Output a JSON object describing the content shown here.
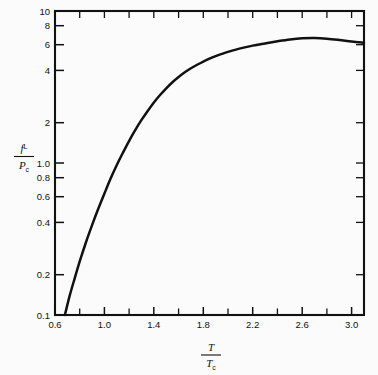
{
  "figure": {
    "background_color": "#fbfbfb",
    "ink_color": "#111111",
    "y_axis_label_numerator": "f",
    "y_axis_label_numerator_sup": "L",
    "y_axis_label_denominator": "P",
    "y_axis_label_denominator_sub": "c",
    "x_axis_label_numerator": "T",
    "x_axis_label_denominator": "T",
    "x_axis_label_denominator_sub": "c"
  },
  "chart_data": {
    "type": "line",
    "title": "",
    "subtitle": "",
    "xlabel": "T/Tc",
    "ylabel": "f L/Pc",
    "xscale": "linear",
    "yscale": "log",
    "xlim": [
      0.6,
      3.1
    ],
    "ylim": [
      0.1,
      10
    ],
    "grid": false,
    "legend": null,
    "x_major_ticks": [
      0.6,
      1.0,
      1.4,
      1.8,
      2.2,
      2.6,
      3.0
    ],
    "x_major_tick_labels": [
      "0.6",
      "1.0",
      "1.4",
      "1.8",
      "2.2",
      "2.6",
      "3.0"
    ],
    "x_minor_ticks": [
      0.8,
      1.2,
      1.6,
      2.0,
      2.4,
      2.8
    ],
    "y_major_ticks": [
      0.1,
      0.2,
      0.4,
      0.6,
      0.8,
      1.0,
      2,
      4,
      6,
      8,
      10
    ],
    "y_major_tick_labels": [
      "0.1",
      "0.2",
      "0.4",
      "0.6",
      "0.8",
      "1.0",
      "2",
      "4",
      "6",
      "8",
      "10"
    ],
    "series": [
      {
        "name": "fugacity of saturated liquid",
        "x": [
          0.68,
          0.72,
          0.76,
          0.8,
          0.85,
          0.9,
          0.95,
          1.0,
          1.05,
          1.1,
          1.15,
          1.2,
          1.25,
          1.3,
          1.35,
          1.4,
          1.45,
          1.5,
          1.55,
          1.6,
          1.65,
          1.7,
          1.75,
          1.8,
          1.85,
          1.9,
          1.95,
          2.0,
          2.1,
          2.2,
          2.3,
          2.4,
          2.5,
          2.6,
          2.7,
          2.8,
          2.9,
          3.0,
          3.1
        ],
        "y": [
          0.1,
          0.135,
          0.175,
          0.225,
          0.3,
          0.39,
          0.5,
          0.63,
          0.79,
          0.97,
          1.17,
          1.4,
          1.65,
          1.92,
          2.2,
          2.5,
          2.8,
          3.1,
          3.4,
          3.68,
          3.95,
          4.2,
          4.43,
          4.65,
          4.86,
          5.05,
          5.22,
          5.38,
          5.68,
          5.92,
          6.12,
          6.32,
          6.5,
          6.62,
          6.65,
          6.58,
          6.45,
          6.3,
          6.18
        ]
      }
    ],
    "annotations": []
  }
}
